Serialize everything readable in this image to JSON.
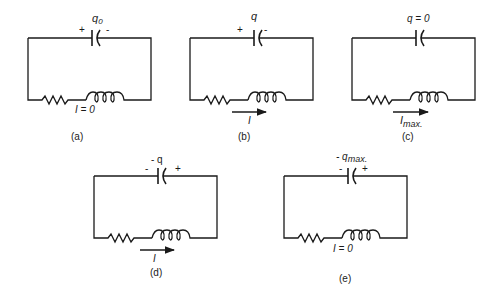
{
  "figure": {
    "circuits": [
      {
        "id": "a",
        "caption": "(a)",
        "charge_label": "q",
        "charge_sub": "0",
        "left_sign": "+",
        "right_sign": "-",
        "current_label": "I = 0",
        "current_arrow": false
      },
      {
        "id": "b",
        "caption": "(b)",
        "charge_label": "q",
        "charge_sub": "",
        "left_sign": "+",
        "right_sign": "-",
        "current_label": "I",
        "current_arrow": true
      },
      {
        "id": "c",
        "caption": "(c)",
        "charge_label": "q = 0",
        "charge_sub": "",
        "left_sign": "",
        "right_sign": "",
        "current_label": "I",
        "current_sub": "max.",
        "current_arrow": true
      },
      {
        "id": "d",
        "caption": "(d)",
        "charge_label": "- q",
        "charge_sub": "",
        "left_sign": "-",
        "right_sign": "+",
        "current_label": "I",
        "current_arrow": true
      },
      {
        "id": "e",
        "caption": "(e)",
        "charge_label": "- q",
        "charge_sub": "max.",
        "left_sign": "-",
        "right_sign": "+",
        "current_label": "I = 0",
        "current_arrow": false
      }
    ]
  }
}
